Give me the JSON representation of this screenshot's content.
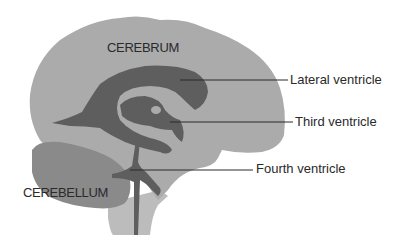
{
  "diagram": {
    "type": "anatomical-sagittal-brain",
    "colors": {
      "cerebrum": "#ababab",
      "ventricles": "#5e5e5e",
      "cerebellum": "#8a8a8a",
      "brainstem": "#bcbcbc",
      "leader_lines": "#2a2a2a",
      "text": "#2a2a2a",
      "background": "#ffffff"
    },
    "regions": {
      "cerebrum": "CEREBRUM",
      "cerebellum": "CEREBELLUM"
    },
    "callouts": [
      {
        "id": "lateral",
        "label": "Lateral ventricle"
      },
      {
        "id": "third",
        "label": "Third ventricle"
      },
      {
        "id": "fourth",
        "label": "Fourth ventricle"
      }
    ]
  }
}
